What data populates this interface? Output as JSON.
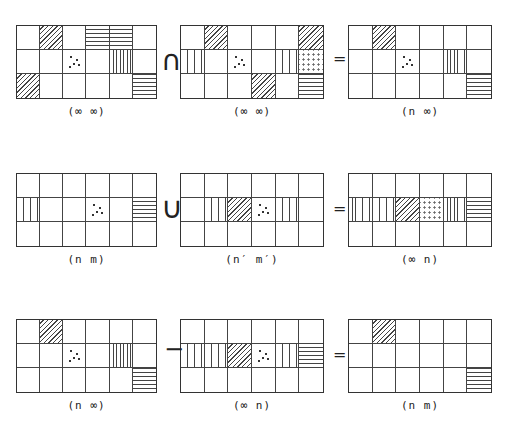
{
  "rows": [
    {
      "operator": "∩",
      "equals": "=",
      "grids": [
        {
          "label": "(∞ ∞)",
          "cells": [
            [
              "",
              "diag",
              "",
              "horiz",
              "horiz",
              ""
            ],
            [
              "",
              "",
              "dots",
              "",
              "vert",
              ""
            ],
            [
              "diag",
              "",
              "",
              "",
              "",
              "horiz"
            ]
          ]
        },
        {
          "label": "(∞ ∞)",
          "cells": [
            [
              "",
              "diag",
              "",
              "",
              "",
              "diag"
            ],
            [
              "vert",
              "",
              "dots",
              "",
              "vert",
              "dots2"
            ],
            [
              "",
              "",
              "",
              "diag",
              "",
              "horiz"
            ]
          ]
        },
        {
          "label": "(n ∞)",
          "cells": [
            [
              "",
              "diag",
              "",
              "",
              "",
              ""
            ],
            [
              "",
              "",
              "dots",
              "",
              "vert",
              ""
            ],
            [
              "",
              "",
              "",
              "",
              "",
              "horiz"
            ]
          ]
        }
      ]
    },
    {
      "operator": "∪",
      "equals": "=",
      "grids": [
        {
          "label": "(n m)",
          "cells": [
            [
              "",
              "",
              "",
              "",
              "",
              ""
            ],
            [
              "vert",
              "",
              "",
              "dots",
              "",
              "horiz"
            ],
            [
              "",
              "",
              "",
              "",
              "",
              ""
            ]
          ]
        },
        {
          "label": "(n′ m′)",
          "cells": [
            [
              "",
              "",
              "",
              "",
              "",
              ""
            ],
            [
              "",
              "vert",
              "diag",
              "dots",
              "vert",
              ""
            ],
            [
              "",
              "",
              "",
              "",
              "",
              ""
            ]
          ]
        },
        {
          "label": "(∞ n)",
          "cells": [
            [
              "",
              "",
              "",
              "",
              "",
              ""
            ],
            [
              "vert",
              "vert",
              "diag",
              "dots2",
              "vert",
              "horiz"
            ],
            [
              "",
              "",
              "",
              "",
              "",
              ""
            ]
          ]
        }
      ]
    },
    {
      "operator": "−",
      "equals": "=",
      "grids": [
        {
          "label": "(n ∞)",
          "cells": [
            [
              "",
              "diag",
              "",
              "",
              "",
              ""
            ],
            [
              "",
              "",
              "dots",
              "",
              "vert",
              ""
            ],
            [
              "",
              "",
              "",
              "",
              "",
              "horiz"
            ]
          ]
        },
        {
          "label": "(∞ n)",
          "cells": [
            [
              "",
              "",
              "",
              "",
              "",
              ""
            ],
            [
              "vert",
              "vert",
              "diag",
              "dots",
              "vert",
              "horiz"
            ],
            [
              "",
              "",
              "",
              "",
              "",
              ""
            ]
          ]
        },
        {
          "label": "(n m)",
          "cells": [
            [
              "",
              "diag",
              "",
              "",
              "",
              ""
            ],
            [
              "",
              "",
              "",
              "",
              "",
              ""
            ],
            [
              "",
              "",
              "",
              "",
              "",
              "horiz"
            ]
          ]
        }
      ]
    }
  ]
}
